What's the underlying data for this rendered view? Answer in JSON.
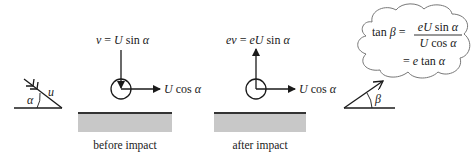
{
  "incoming": {
    "speed_label": "u",
    "angle_label": "α"
  },
  "before": {
    "vertical_label": {
      "lhs": "v",
      "eq": " = ",
      "rhs_a": "U",
      "rhs_b": " sin ",
      "rhs_c": "α"
    },
    "horizontal_label": {
      "a": "U",
      "b": " cos ",
      "c": "α"
    },
    "caption": "before impact"
  },
  "after": {
    "vertical_label": {
      "lhs": "ev",
      "eq": " = ",
      "rhs_a": "eU",
      "rhs_b": " sin ",
      "rhs_c": "α"
    },
    "horizontal_label": {
      "a": "U",
      "b": " cos ",
      "c": "α"
    },
    "caption": "after impact"
  },
  "outgoing": {
    "angle_label": "β"
  },
  "thought_bubble": {
    "line1_lhs_a": "tan ",
    "line1_lhs_b": "β",
    "line1_eq": " = ",
    "numerator_a": "eU",
    "numerator_b": " sin ",
    "numerator_c": "α",
    "denominator_a": "U",
    "denominator_b": " cos ",
    "denominator_c": "α",
    "line2_eq": "= ",
    "line2_a": "e",
    "line2_b": " tan ",
    "line2_c": "α"
  },
  "colors": {
    "ink": "#1a1a1a",
    "ground_fill": "#c8c8c8",
    "ground_edge": "#333333",
    "cloud_stroke": "#777777"
  }
}
